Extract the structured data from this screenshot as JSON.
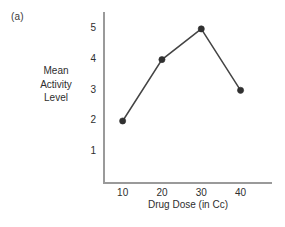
{
  "figure": {
    "panel_label": "(a)",
    "background_color": "#ffffff"
  },
  "chart_data": {
    "type": "line",
    "title": "",
    "subtitle": "",
    "xlabel": "Drug Dose (in Cc)",
    "ylabel": "Mean Activity Level",
    "ylabel_lines": [
      "Mean",
      "Activity",
      "Level"
    ],
    "x": [
      10,
      20,
      30,
      40
    ],
    "values": [
      2,
      4,
      5,
      3
    ],
    "series": [
      {
        "name": "Mean Activity Level",
        "values": [
          2,
          4,
          5,
          3
        ]
      }
    ],
    "points": [
      {
        "x": 10,
        "y": 2
      },
      {
        "x": 20,
        "y": 4
      },
      {
        "x": 30,
        "y": 5
      },
      {
        "x": 40,
        "y": 3
      }
    ],
    "xtick_labels": [
      "10",
      "20",
      "30",
      "40"
    ],
    "ytick_labels": [
      "1",
      "2",
      "3",
      "4",
      "5"
    ],
    "xticks": [
      10,
      20,
      30,
      40
    ],
    "yticks": [
      1,
      2,
      3,
      4,
      5
    ],
    "xlim": [
      5,
      48
    ],
    "ylim": [
      0,
      5.55
    ],
    "grid": false,
    "legend": false,
    "legend_position": "none",
    "marker": "circle",
    "line_color": "#444444",
    "marker_color": "#303030",
    "axis_color": "#9a9a9a",
    "text_color": "#2e2e2e",
    "annotations": []
  }
}
